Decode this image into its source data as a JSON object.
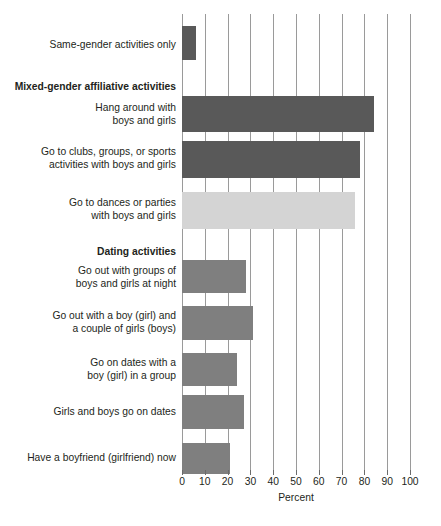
{
  "chart_data": {
    "type": "bar",
    "orientation": "horizontal",
    "title": "",
    "subtitle": "",
    "xlabel": "Percent",
    "ylabel": "",
    "xlim": [
      0,
      100
    ],
    "xticks": [
      0,
      10,
      20,
      30,
      40,
      50,
      60,
      70,
      80,
      90,
      100
    ],
    "xtick_labels": [
      "0",
      "10",
      "20",
      "30",
      "40",
      "50",
      "60",
      "70",
      "80",
      "90",
      "100"
    ],
    "grid": "vertical",
    "legend": "none",
    "categories": [
      "Same-gender activities only",
      "Hang around with\nboys and girls",
      "Go to clubs, groups, or sports\nactivities with boys and girls",
      "Go to dances or parties\nwith boys and girls",
      "Go out with groups of\nboys and girls at night",
      "Go out with a boy (girl) and\na couple of girls (boys)",
      "Go on dates with a\nboy (girl) in a group",
      "Girls and boys go on dates",
      "Have a boyfriend (girlfriend) now"
    ],
    "values": [
      6,
      84,
      78,
      76,
      28,
      31,
      24,
      27,
      21
    ],
    "bar_colors": [
      "#595959",
      "#595959",
      "#595959",
      "#d4d4d4",
      "#7f7f7f",
      "#7f7f7f",
      "#7f7f7f",
      "#7f7f7f",
      "#7f7f7f"
    ],
    "group_headers": [
      {
        "label": "Mixed-gender affiliative activities",
        "before_category_index": 1
      },
      {
        "label": "Dating activities",
        "before_category_index": 4
      }
    ]
  },
  "rows": [
    {
      "label": "Same-gender activities only",
      "value": 6,
      "color": "#595959",
      "bar_top": 26,
      "bar_height": 34,
      "label_top": 38,
      "bold": false
    },
    {
      "label": "Mixed-gender affiliative activities",
      "value": null,
      "color": null,
      "bar_top": null,
      "bar_height": null,
      "label_top": 80,
      "bold": true
    },
    {
      "label": "Hang around with\nboys and girls",
      "value": 84,
      "color": "#595959",
      "bar_top": 96,
      "bar_height": 36,
      "label_top": 101,
      "bold": false
    },
    {
      "label": "Go to clubs, groups, or sports\nactivities with boys and girls",
      "value": 78,
      "color": "#595959",
      "bar_top": 141,
      "bar_height": 37,
      "label_top": 145,
      "bold": false
    },
    {
      "label": "Go to dances or parties\nwith boys and girls",
      "value": 76,
      "color": "#d4d4d4",
      "bar_top": 192,
      "bar_height": 37,
      "label_top": 196,
      "bold": false
    },
    {
      "label": "Dating activities",
      "value": null,
      "color": null,
      "bar_top": null,
      "bar_height": null,
      "label_top": 245,
      "bold": true
    },
    {
      "label": "Go out with groups of\nboys and girls at night",
      "value": 28,
      "color": "#7f7f7f",
      "bar_top": 260,
      "bar_height": 33,
      "label_top": 264,
      "bold": false
    },
    {
      "label": "Go out with a boy (girl) and\na couple of girls (boys)",
      "value": 31,
      "color": "#7f7f7f",
      "bar_top": 306,
      "bar_height": 34,
      "label_top": 309,
      "bold": false
    },
    {
      "label": "Go on dates with a\nboy (girl) in a group",
      "value": 24,
      "color": "#7f7f7f",
      "bar_top": 353,
      "bar_height": 33,
      "label_top": 356,
      "bold": false
    },
    {
      "label": "Girls and boys go on dates",
      "value": 27,
      "color": "#7f7f7f",
      "bar_top": 395,
      "bar_height": 34,
      "label_top": 405,
      "bold": false
    },
    {
      "label": "Have a boyfriend (girlfriend) now",
      "value": 21,
      "color": "#7f7f7f",
      "bar_top": 443,
      "bar_height": 31,
      "label_top": 451,
      "bold": false
    }
  ],
  "axis": {
    "title": "Percent",
    "ticks": [
      "0",
      "10",
      "20",
      "30",
      "40",
      "50",
      "60",
      "70",
      "80",
      "90",
      "100"
    ]
  },
  "colors": {
    "bar_dark": "#595959",
    "bar_mid": "#7f7f7f",
    "bar_light": "#d4d4d4",
    "gridline": "#9a9a9a",
    "text": "#231f20",
    "background": "#ffffff"
  }
}
